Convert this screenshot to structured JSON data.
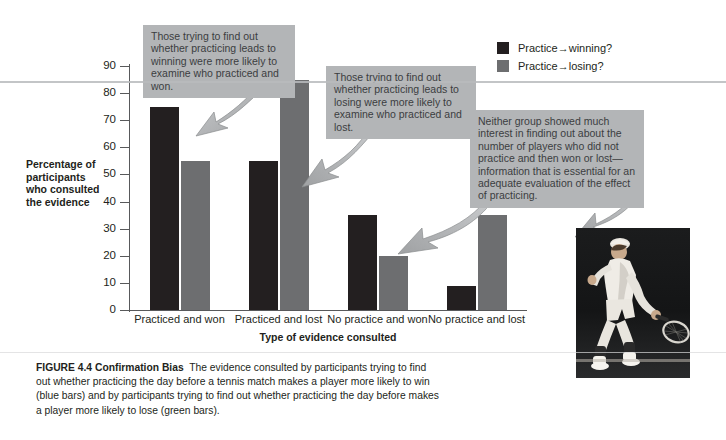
{
  "figure": {
    "label": "FIGURE 4.4",
    "title": "Confirmation Bias",
    "caption": "The evidence consulted by participants trying to find out whether practicing the day before a tennis match makes a player more likely to win (blue bars) and by participants trying to find out whether practicing the day before makes a player more likely to lose (green bars)."
  },
  "chart_data": {
    "type": "bar",
    "title": "",
    "xlabel": "Type of evidence consulted",
    "ylabel": "Percentage of participants who consulted the evidence",
    "ylim": [
      0,
      90
    ],
    "yticks": [
      0,
      10,
      20,
      30,
      40,
      50,
      60,
      70,
      80,
      90
    ],
    "grid": false,
    "legend_position": "top-right",
    "categories": [
      "Practiced and won",
      "Practiced and lost",
      "No practice and won",
      "No practice and lost"
    ],
    "series": [
      {
        "name": "Practice→winning?",
        "color": "#231f20",
        "values": [
          75,
          55,
          35,
          9
        ]
      },
      {
        "name": "Practice→losing?",
        "color": "#6d6e70",
        "values": [
          55,
          85,
          20,
          35
        ]
      }
    ]
  },
  "axis_titles": {
    "y_lines": [
      "Percentage of",
      "participants",
      "who consulted",
      "the evidence"
    ],
    "x": "Type of evidence consulted"
  },
  "callouts": [
    {
      "id": "callout-1",
      "text": "Those trying to find out whether practicing leads to winning were more likely to examine who practiced and won.",
      "points_to": "Practiced and won — dark bar"
    },
    {
      "id": "callout-2",
      "text": "Those trying to find out whether practicing leads to losing were more likely to examine who practiced and lost.",
      "points_to": "Practiced and lost — gray bar"
    },
    {
      "id": "callout-3",
      "text": "Neither group showed much interest in finding out about the number of players who did not practice and then won or lost—information that is essential for an adequate evaluation of the effect of practicing.",
      "points_to": "No practice groups"
    }
  ],
  "photo": {
    "alt": "tennis player hitting a backhand"
  },
  "colors": {
    "bar_dark": "#231f20",
    "bar_gray": "#6d6e70",
    "callout_bg": "#b3b5b7",
    "axis": "#58595b",
    "text": "#231f20"
  }
}
